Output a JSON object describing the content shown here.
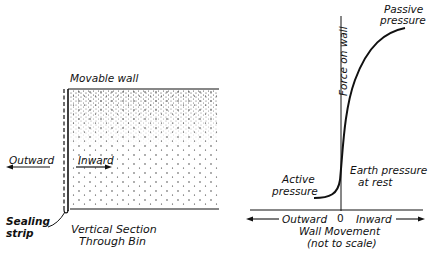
{
  "left_panel": {
    "movable_wall": "Movable wall",
    "outward": "Outward",
    "inward": "Inward",
    "sealing_strip_1": "Sealing",
    "sealing_strip_2": "strip",
    "caption_1": "Vertical Section",
    "caption_2": "Through Bin"
  },
  "right_panel": {
    "y_axis": "Force on wall",
    "passive_1": "Passive",
    "passive_2": "pressure",
    "active_1": "Active",
    "active_2": "pressure",
    "rest_1": "Earth pressure",
    "rest_2": "at rest",
    "x_outward": "Outward",
    "x_zero": "0",
    "x_inward": "Inward",
    "x_label_1": "Wall Movement",
    "x_label_2": "(not to scale)"
  }
}
